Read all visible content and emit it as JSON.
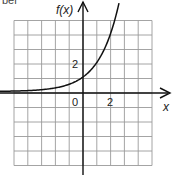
{
  "header": {
    "cut_text": "ber"
  },
  "chart_data": {
    "type": "line",
    "title": "",
    "xlabel": "x",
    "ylabel": "f(x)",
    "function": "f(x) = 2^x",
    "series": [
      {
        "name": "f(x)",
        "x": [
          -6,
          -5,
          -4,
          -3,
          -2,
          -1,
          0,
          1,
          2,
          2.3,
          2.6
        ],
        "values": [
          0.016,
          0.031,
          0.063,
          0.125,
          0.25,
          0.5,
          1,
          2,
          4,
          4.9,
          6.1
        ]
      }
    ],
    "tick_labels": {
      "origin": "0",
      "x": [
        "2"
      ],
      "y": [
        "2"
      ]
    },
    "xlim": [
      -5,
      5
    ],
    "ylim": [
      -5,
      5
    ],
    "grid": true,
    "grid_step": 1,
    "colors": {
      "grid": "#9a9a9a",
      "axis": "#111111",
      "curve": "#111111"
    }
  }
}
